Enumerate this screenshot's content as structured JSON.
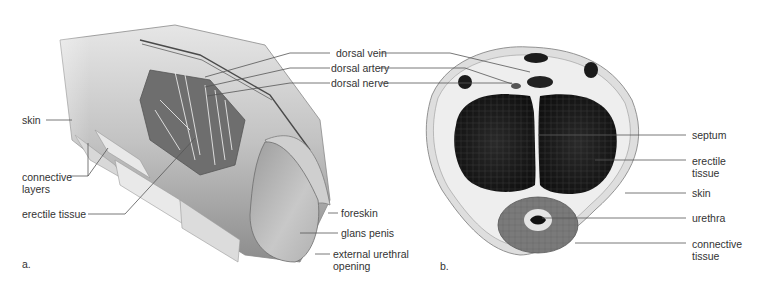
{
  "figure": {
    "panels": [
      {
        "id": "a",
        "letter": "a.",
        "title": "Cutaway view",
        "labels": {
          "dorsal_vein": "dorsal vein",
          "dorsal_artery": "dorsal artery",
          "dorsal_nerve": "dorsal nerve",
          "skin": "skin",
          "connective_layers": "connective layers",
          "erectile_tissue": "erectile tissue",
          "foreskin": "foreskin",
          "glans_penis": "glans penis",
          "external_urethral_opening": "external urethral opening"
        }
      },
      {
        "id": "b",
        "letter": "b.",
        "title": "Cross-section",
        "labels": {
          "septum": "septum",
          "erectile_tissue": "erectile tissue",
          "skin": "skin",
          "urethra": "urethra",
          "connective_tissue": "connective tissue"
        }
      }
    ],
    "colors": {
      "background": "#ffffff",
      "label_text": "#333333",
      "leader_line": "#555555",
      "tissue_light": "#d9d9d9",
      "tissue_mid": "#a8a8a8",
      "tissue_dark": "#1a1a1a"
    }
  }
}
